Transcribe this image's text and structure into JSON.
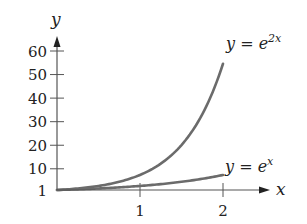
{
  "chart_data": {
    "type": "line",
    "title": "",
    "xlabel": "x",
    "ylabel": "y",
    "xlim": [
      0,
      2.4
    ],
    "ylim": [
      1,
      65
    ],
    "x_ticks": [
      1,
      2
    ],
    "x_tick_labels": [
      "1",
      "2"
    ],
    "y_ticks": [
      1,
      10,
      20,
      30,
      40,
      50,
      60
    ],
    "y_tick_labels": [
      "1",
      "10",
      "20",
      "30",
      "40",
      "50",
      "60"
    ],
    "grid": false,
    "legend": "inline labels at curve ends",
    "series": [
      {
        "name": "y = e^{2x}",
        "label_base": "y = e",
        "label_exp": "2x",
        "x": [
          0,
          0.25,
          0.5,
          0.75,
          1,
          1.25,
          1.5,
          1.75,
          2
        ],
        "values": [
          1,
          1.65,
          2.72,
          4.48,
          7.39,
          12.18,
          20.09,
          33.12,
          54.6
        ],
        "color": "#6b6b6b"
      },
      {
        "name": "y = e^{x}",
        "label_base": "y = e",
        "label_exp": "x",
        "x": [
          0,
          0.25,
          0.5,
          0.75,
          1,
          1.25,
          1.5,
          1.75,
          2
        ],
        "values": [
          1,
          1.28,
          1.65,
          2.12,
          2.72,
          3.49,
          4.48,
          5.75,
          7.39
        ],
        "color": "#6b6b6b"
      }
    ]
  }
}
